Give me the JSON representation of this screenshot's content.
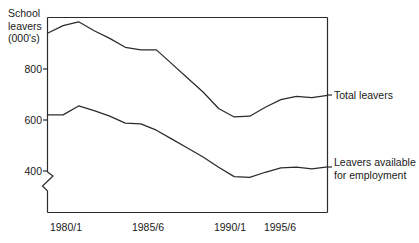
{
  "chart_data": {
    "type": "line",
    "title": "",
    "ylabel": "School\nleavers\n(000's)",
    "ylabel_lines": [
      "School",
      "leavers",
      "(000's)"
    ],
    "xlabel": "",
    "grid": false,
    "legend_position": "right-inline",
    "axis_break": true,
    "axis_break_note": "y-axis broken below 400",
    "ylim": [
      280,
      1040
    ],
    "yticks": [
      400,
      600,
      800
    ],
    "ytick_labels": [
      "400",
      "600",
      "800"
    ],
    "xticks": [
      "1980/1",
      "1985/6",
      "1990/1",
      "1995/6"
    ],
    "x": [
      "1980/1",
      "1981/2",
      "1982/3",
      "1983/4",
      "1984/5",
      "1985/6",
      "1986/7",
      "1987/8",
      "1988/9",
      "1989/0",
      "1990/1",
      "1991/2",
      "1992/3",
      "1993/4",
      "1994/5",
      "1995/6",
      "1996/7",
      "1997/8",
      "1998/9"
    ],
    "series": [
      {
        "name": "Total leavers",
        "label": "Total leavers",
        "color": "#2b2b2b",
        "values": [
          940,
          970,
          985,
          950,
          920,
          885,
          875,
          875,
          820,
          765,
          710,
          645,
          612,
          615,
          650,
          680,
          693,
          688,
          697
        ]
      },
      {
        "name": "Leavers available for employment",
        "label": "Leavers available\nfor employment",
        "label_lines": [
          "Leavers available",
          "for employment"
        ],
        "color": "#2b2b2b",
        "values": [
          620,
          620,
          655,
          637,
          615,
          588,
          585,
          560,
          525,
          490,
          455,
          415,
          378,
          375,
          395,
          412,
          415,
          408,
          416
        ]
      }
    ]
  },
  "axes": {
    "frame_color": "#2b2b2b",
    "tick_color": "#2b2b2b"
  }
}
